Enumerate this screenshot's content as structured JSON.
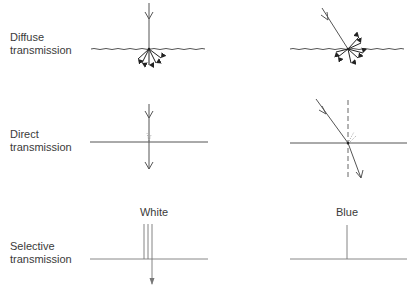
{
  "rows": [
    {
      "id": "diffuse",
      "label_line1": "Diffuse",
      "label_line2": "transmission"
    },
    {
      "id": "direct",
      "label_line1": "Direct",
      "label_line2": "transmission"
    },
    {
      "id": "selective",
      "label_line1": "Selective",
      "label_line2": "transmission"
    }
  ],
  "columns": {
    "selective_left": "White",
    "selective_right": "Blue"
  },
  "colors": {
    "line": "#555555",
    "arrow_dark": "#222222",
    "light_line": "#888888"
  }
}
